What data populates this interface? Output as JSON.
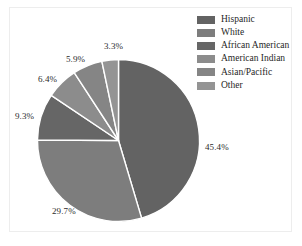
{
  "figure": {
    "background_color": "#ffffff",
    "frame_color": "#ededed"
  },
  "legend": {
    "position": "top-right",
    "items": [
      {
        "label": "Hispanic",
        "color": "#636363"
      },
      {
        "label": "White",
        "color": "#7d7d7d"
      },
      {
        "label": "African American",
        "color": "#666666"
      },
      {
        "label": "American Indian",
        "color": "#8c8c8c"
      },
      {
        "label": "Asian/Pacific",
        "color": "#858585"
      },
      {
        "label": "Other",
        "color": "#949494"
      }
    ]
  },
  "labels": {
    "hispanic": "45.4%",
    "white": "29.7%",
    "african_american": "9.3%",
    "american_indian": "6.4%",
    "asian_pacific": "5.9%",
    "other": "3.3%"
  },
  "chart_data": {
    "type": "pie",
    "title": "",
    "categories": [
      "Hispanic",
      "White",
      "African American",
      "American Indian",
      "Asian/Pacific",
      "Other"
    ],
    "values": [
      45.4,
      29.7,
      9.3,
      6.4,
      5.9,
      3.3
    ],
    "value_labels": [
      "45.4%",
      "29.7%",
      "9.3%",
      "6.4%",
      "5.9%",
      "3.3%"
    ],
    "units": "percent",
    "start_angle_deg": 0,
    "direction": "clockwise",
    "colors": [
      "#636363",
      "#7d7d7d",
      "#666666",
      "#8c8c8c",
      "#858585",
      "#949494"
    ],
    "slice_separator_color": "#ffffff",
    "legend_position": "top-right",
    "grid": false
  }
}
